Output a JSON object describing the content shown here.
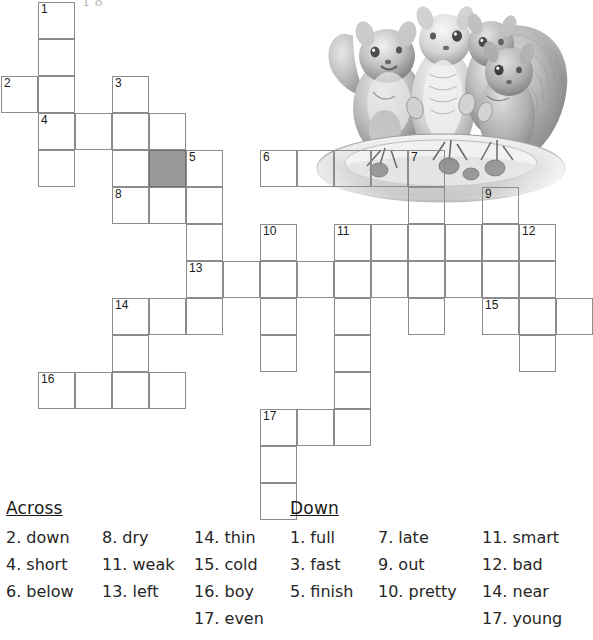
{
  "page": {
    "top_partial_text": "1 8",
    "grid": {
      "cell_size": 37,
      "origin_x": 1,
      "origin_y": 2,
      "shaded_color": "#9a9a9a",
      "border_color": "#8c8c8c",
      "cells": [
        {
          "c": 1,
          "r": 0,
          "n": "1"
        },
        {
          "c": 1,
          "r": 1,
          "n": ""
        },
        {
          "c": 0,
          "r": 2,
          "n": "2"
        },
        {
          "c": 1,
          "r": 2,
          "n": ""
        },
        {
          "c": 3,
          "r": 2,
          "n": "3"
        },
        {
          "c": 1,
          "r": 3,
          "n": "4"
        },
        {
          "c": 2,
          "r": 3,
          "n": ""
        },
        {
          "c": 3,
          "r": 3,
          "n": ""
        },
        {
          "c": 4,
          "r": 3,
          "n": ""
        },
        {
          "c": 1,
          "r": 4,
          "n": ""
        },
        {
          "c": 3,
          "r": 4,
          "n": ""
        },
        {
          "c": 4,
          "r": 4,
          "n": "",
          "shaded": true
        },
        {
          "c": 5,
          "r": 4,
          "n": "5"
        },
        {
          "c": 7,
          "r": 4,
          "n": "6"
        },
        {
          "c": 8,
          "r": 4,
          "n": ""
        },
        {
          "c": 9,
          "r": 4,
          "n": ""
        },
        {
          "c": 10,
          "r": 4,
          "n": ""
        },
        {
          "c": 11,
          "r": 4,
          "n": "7"
        },
        {
          "c": 3,
          "r": 5,
          "n": "8"
        },
        {
          "c": 4,
          "r": 5,
          "n": ""
        },
        {
          "c": 5,
          "r": 5,
          "n": ""
        },
        {
          "c": 11,
          "r": 5,
          "n": ""
        },
        {
          "c": 13,
          "r": 5,
          "n": "9"
        },
        {
          "c": 5,
          "r": 6,
          "n": ""
        },
        {
          "c": 7,
          "r": 6,
          "n": "10"
        },
        {
          "c": 9,
          "r": 6,
          "n": "11"
        },
        {
          "c": 10,
          "r": 6,
          "n": ""
        },
        {
          "c": 11,
          "r": 6,
          "n": ""
        },
        {
          "c": 12,
          "r": 6,
          "n": ""
        },
        {
          "c": 13,
          "r": 6,
          "n": ""
        },
        {
          "c": 14,
          "r": 6,
          "n": "12"
        },
        {
          "c": 5,
          "r": 7,
          "n": "13"
        },
        {
          "c": 6,
          "r": 7,
          "n": ""
        },
        {
          "c": 7,
          "r": 7,
          "n": ""
        },
        {
          "c": 8,
          "r": 7,
          "n": ""
        },
        {
          "c": 9,
          "r": 7,
          "n": ""
        },
        {
          "c": 10,
          "r": 7,
          "n": ""
        },
        {
          "c": 11,
          "r": 7,
          "n": ""
        },
        {
          "c": 12,
          "r": 7,
          "n": ""
        },
        {
          "c": 13,
          "r": 7,
          "n": ""
        },
        {
          "c": 14,
          "r": 7,
          "n": ""
        },
        {
          "c": 3,
          "r": 8,
          "n": "14"
        },
        {
          "c": 4,
          "r": 8,
          "n": ""
        },
        {
          "c": 5,
          "r": 8,
          "n": ""
        },
        {
          "c": 7,
          "r": 8,
          "n": ""
        },
        {
          "c": 9,
          "r": 8,
          "n": ""
        },
        {
          "c": 11,
          "r": 8,
          "n": ""
        },
        {
          "c": 13,
          "r": 8,
          "n": "15"
        },
        {
          "c": 14,
          "r": 8,
          "n": ""
        },
        {
          "c": 15,
          "r": 8,
          "n": ""
        },
        {
          "c": 3,
          "r": 9,
          "n": ""
        },
        {
          "c": 7,
          "r": 9,
          "n": ""
        },
        {
          "c": 9,
          "r": 9,
          "n": ""
        },
        {
          "c": 14,
          "r": 9,
          "n": ""
        },
        {
          "c": 1,
          "r": 10,
          "n": "16"
        },
        {
          "c": 2,
          "r": 10,
          "n": ""
        },
        {
          "c": 3,
          "r": 10,
          "n": ""
        },
        {
          "c": 4,
          "r": 10,
          "n": ""
        },
        {
          "c": 9,
          "r": 10,
          "n": ""
        },
        {
          "c": 7,
          "r": 11,
          "n": "17"
        },
        {
          "c": 8,
          "r": 11,
          "n": ""
        },
        {
          "c": 9,
          "r": 11,
          "n": ""
        },
        {
          "c": 7,
          "r": 12,
          "n": ""
        },
        {
          "c": 7,
          "r": 13,
          "n": ""
        }
      ]
    },
    "illustration": {
      "name": "squirrels-on-plate-illustration",
      "description": "Pencil drawing of four squirrels gathered around a plate of nuts"
    },
    "clues": {
      "across": {
        "title": "Across",
        "columns": [
          [
            "2. down",
            "4. short",
            "6. below"
          ],
          [
            "8. dry",
            "11. weak",
            "13. left"
          ],
          [
            "14. thin",
            "15. cold",
            "16. boy",
            "17. even"
          ]
        ]
      },
      "down": {
        "title": "Down",
        "columns": [
          [
            "1. full",
            "3. fast",
            "5. finish"
          ],
          [
            "7. late",
            "9. out",
            "10. pretty"
          ],
          [
            "11. smart",
            "12. bad",
            "14. near",
            "17. young"
          ]
        ]
      }
    }
  }
}
